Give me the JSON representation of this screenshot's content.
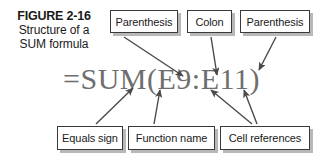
{
  "figure": {
    "number": "FIGURE 2-16",
    "title_line1": "Structure of a",
    "title_line2": "SUM formula"
  },
  "formula": {
    "text": "=SUM(E9:E11)",
    "color": "#6e6e6e",
    "parts": {
      "equals_sign": "=",
      "function_name": "SUM",
      "open_parenthesis": "(",
      "first_cell_reference": "E9",
      "colon": ":",
      "second_cell_reference": "E11",
      "close_parenthesis": ")"
    }
  },
  "callouts": {
    "top": [
      {
        "id": "paren-open",
        "label": "Parenthesis"
      },
      {
        "id": "colon",
        "label": "Colon"
      },
      {
        "id": "paren-close",
        "label": "Parenthesis"
      }
    ],
    "bottom": [
      {
        "id": "equals",
        "label": "Equals sign"
      },
      {
        "id": "funcname",
        "label": "Function name"
      },
      {
        "id": "cellrefs",
        "label": "Cell references"
      }
    ]
  },
  "style": {
    "box_border_color": "#3a3a3a",
    "box_shadow_color": "#b8b8b8",
    "arrow_color": "#4a4a4a",
    "text_color": "#1a1a1a",
    "background": "#ffffff"
  },
  "arrows": [
    {
      "id": "arrow-paren-open-to-formula",
      "from": "Parenthesis box (left)",
      "to": "open parenthesis in formula"
    },
    {
      "id": "arrow-colon-to-formula",
      "from": "Colon box",
      "to": "colon in formula"
    },
    {
      "id": "arrow-paren-close-to-formula",
      "from": "Parenthesis box (right)",
      "to": "close parenthesis in formula"
    },
    {
      "id": "arrow-equals-to-formula",
      "from": "Equals sign box",
      "to": "equals sign in formula"
    },
    {
      "id": "arrow-funcname-to-formula",
      "from": "Function name box",
      "to": "SUM in formula"
    },
    {
      "id": "arrow-cellref1-to-formula",
      "from": "Cell references box",
      "to": "E9 in formula"
    },
    {
      "id": "arrow-cellref2-to-formula",
      "from": "Cell references box",
      "to": "E11 in formula"
    }
  ]
}
